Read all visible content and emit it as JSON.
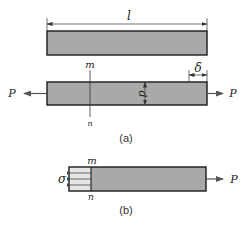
{
  "diagram": {
    "colors": {
      "bar_fill": "#a9a9a9",
      "bar_stroke": "#1a1a1a",
      "stress_region_fill": "#e6e6e6",
      "line": "#333333",
      "arrow": "#555555"
    },
    "labels": {
      "length": "l",
      "elongation": "δ",
      "depth": "d",
      "section_top": "m",
      "section_bottom": "n",
      "force_left": "P",
      "force_right": "P",
      "stress": "σ",
      "caption_a": "(a)",
      "caption_b": "(b)"
    },
    "panels": [
      {
        "id": "a",
        "caption": "(a)",
        "elements": [
          "undeformed bar with length dimension l",
          "deformed bar under tensile force P at both ends",
          "elongation δ",
          "cross-section dimension d",
          "section line m-n"
        ]
      },
      {
        "id": "b",
        "caption": "(b)",
        "elements": [
          "free body of bar cut at m-n",
          "uniform normal stress σ acting on section",
          "tensile force P on right end"
        ]
      }
    ]
  }
}
